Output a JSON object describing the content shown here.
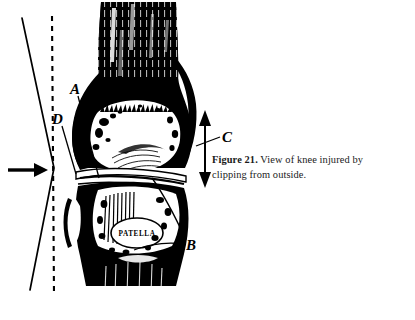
{
  "figure": {
    "number_label": "Figure 21.",
    "caption_text": "View of knee injured by clipping from outside.",
    "style": "high-contrast black and white halftone engraving"
  },
  "labels": {
    "a": "A",
    "b": "B",
    "c": "C",
    "d": "D",
    "patella": "PATELLA"
  },
  "annotations": {
    "force_arrow": "arrow-pointing-right",
    "vertical_double_arrow": "double-headed-vertical-arrow",
    "dashed_reference_line": "vertical-dashed-line",
    "limb_axis_line": "solid-angled-line"
  },
  "colors": {
    "ink": "#000000",
    "background": "#ffffff",
    "caption_ink": "#1a1a1a"
  }
}
